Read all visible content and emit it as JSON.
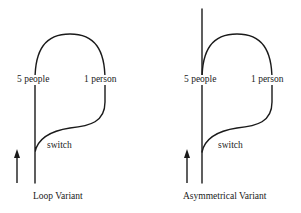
{
  "diagrams": [
    {
      "caption": "Loop Variant",
      "left_label": "5 people",
      "right_label": "1 person",
      "switch_label": "switch"
    },
    {
      "caption": "Asymmetrical Variant",
      "left_label": "5 people",
      "right_label": "1 person",
      "switch_label": "switch"
    }
  ],
  "colors": {
    "line": "#1a1a1a",
    "background": "#ffffff"
  }
}
